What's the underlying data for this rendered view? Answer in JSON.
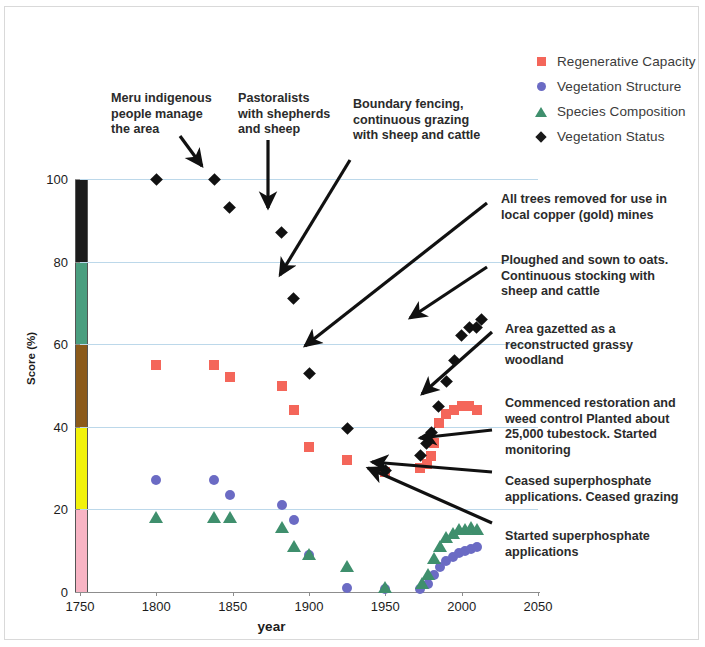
{
  "chart_data": {
    "type": "scatter",
    "title": "",
    "xlabel": "year",
    "ylabel": "Score (%)",
    "xlim": [
      1750,
      2050
    ],
    "ylim": [
      0,
      100
    ],
    "xticks": [
      1750,
      1800,
      1850,
      1900,
      1950,
      2000,
      2050
    ],
    "yticks": [
      0,
      20,
      40,
      60,
      80,
      100
    ],
    "grid": true,
    "legend_position": "top-right",
    "series": [
      {
        "name": "Regenerative Capacity",
        "marker": "square",
        "color": "#f4665a",
        "points": [
          {
            "x": 1800,
            "y": 55
          },
          {
            "x": 1838,
            "y": 55
          },
          {
            "x": 1848,
            "y": 52
          },
          {
            "x": 1882,
            "y": 50
          },
          {
            "x": 1890,
            "y": 44
          },
          {
            "x": 1900,
            "y": 35
          },
          {
            "x": 1925,
            "y": 32
          },
          {
            "x": 1950,
            "y": 29
          },
          {
            "x": 1973,
            "y": 30
          },
          {
            "x": 1977,
            "y": 31
          },
          {
            "x": 1980,
            "y": 33
          },
          {
            "x": 1982,
            "y": 36
          },
          {
            "x": 1985,
            "y": 41
          },
          {
            "x": 1990,
            "y": 43
          },
          {
            "x": 1995,
            "y": 44
          },
          {
            "x": 2000,
            "y": 45
          },
          {
            "x": 2005,
            "y": 45
          },
          {
            "x": 2010,
            "y": 44
          }
        ]
      },
      {
        "name": "Vegetation Structure",
        "marker": "circle",
        "color": "#6b6bc4",
        "points": [
          {
            "x": 1800,
            "y": 27
          },
          {
            "x": 1838,
            "y": 27
          },
          {
            "x": 1848,
            "y": 23.5
          },
          {
            "x": 1882,
            "y": 21
          },
          {
            "x": 1890,
            "y": 17.5
          },
          {
            "x": 1900,
            "y": 9
          },
          {
            "x": 1925,
            "y": 1
          },
          {
            "x": 1950,
            "y": 0.8
          },
          {
            "x": 1973,
            "y": 0.8
          },
          {
            "x": 1978,
            "y": 2
          },
          {
            "x": 1982,
            "y": 4
          },
          {
            "x": 1986,
            "y": 6
          },
          {
            "x": 1990,
            "y": 7.5
          },
          {
            "x": 1994,
            "y": 8.5
          },
          {
            "x": 1998,
            "y": 9.5
          },
          {
            "x": 2002,
            "y": 10
          },
          {
            "x": 2006,
            "y": 10.5
          },
          {
            "x": 2010,
            "y": 11
          }
        ]
      },
      {
        "name": "Species Composition",
        "marker": "triangle",
        "color": "#3f8f6d",
        "points": [
          {
            "x": 1800,
            "y": 18
          },
          {
            "x": 1838,
            "y": 18
          },
          {
            "x": 1848,
            "y": 18
          },
          {
            "x": 1882,
            "y": 15.5
          },
          {
            "x": 1890,
            "y": 11
          },
          {
            "x": 1900,
            "y": 9
          },
          {
            "x": 1925,
            "y": 6
          },
          {
            "x": 1950,
            "y": 1
          },
          {
            "x": 1974,
            "y": 2
          },
          {
            "x": 1978,
            "y": 4
          },
          {
            "x": 1982,
            "y": 8
          },
          {
            "x": 1986,
            "y": 11
          },
          {
            "x": 1990,
            "y": 13
          },
          {
            "x": 1994,
            "y": 14
          },
          {
            "x": 1998,
            "y": 15
          },
          {
            "x": 2002,
            "y": 15
          },
          {
            "x": 2006,
            "y": 15.5
          },
          {
            "x": 2010,
            "y": 15
          }
        ]
      },
      {
        "name": "Vegetation Status",
        "marker": "diamond",
        "color": "#111111",
        "points": [
          {
            "x": 1800,
            "y": 100
          },
          {
            "x": 1838,
            "y": 100
          },
          {
            "x": 1848,
            "y": 93
          },
          {
            "x": 1882,
            "y": 87
          },
          {
            "x": 1890,
            "y": 71
          },
          {
            "x": 1900,
            "y": 53
          },
          {
            "x": 1925,
            "y": 39.5
          },
          {
            "x": 1950,
            "y": 29.5
          },
          {
            "x": 1973,
            "y": 33
          },
          {
            "x": 1977,
            "y": 36
          },
          {
            "x": 1980,
            "y": 38.5
          },
          {
            "x": 1985,
            "y": 45
          },
          {
            "x": 1990,
            "y": 51
          },
          {
            "x": 1995,
            "y": 56
          },
          {
            "x": 2000,
            "y": 62
          },
          {
            "x": 2005,
            "y": 64
          },
          {
            "x": 2010,
            "y": 64
          },
          {
            "x": 2013,
            "y": 66
          }
        ]
      }
    ],
    "colorbar": {
      "label": "",
      "bands": [
        {
          "from": 80,
          "to": 100,
          "color": "#1c1c1c"
        },
        {
          "from": 60,
          "to": 80,
          "color": "#4a9e7f"
        },
        {
          "from": 40,
          "to": 60,
          "color": "#8b5a1a"
        },
        {
          "from": 20,
          "to": 40,
          "color": "#f2f20a"
        },
        {
          "from": 0,
          "to": 20,
          "color": "#f8b4c4"
        }
      ]
    },
    "annotations": [
      "Meru indigenous people manage the area",
      "Pastoralists with shepherds and sheep",
      "Boundary fencing, continuous grazing with sheep and cattle",
      "All trees removed for use in local copper (gold) mines",
      "Ploughed and sown to oats. Continuous stocking with sheep and cattle",
      "Area gazetted as a reconstructed grassy woodland",
      "Commenced restoration and weed control Planted about 25,000 tubestock. Started monitoring",
      "Ceased superphosphate applications. Ceased grazing",
      "Started superphosphate applications"
    ]
  },
  "legend": {
    "items": [
      {
        "label": "Regenerative Capacity",
        "marker": "square"
      },
      {
        "label": "Vegetation Structure",
        "marker": "circle"
      },
      {
        "label": "Species Composition",
        "marker": "triangle"
      },
      {
        "label": "Vegetation Status",
        "marker": "diamond"
      }
    ]
  },
  "axes": {
    "x_title": "year",
    "y_title": "Score (%)",
    "x_ticks": [
      "1750",
      "1800",
      "1850",
      "1900",
      "1950",
      "2000",
      "2050"
    ],
    "y_ticks": [
      "0",
      "20",
      "40",
      "60",
      "80",
      "100"
    ]
  },
  "annotations": {
    "a1": {
      "line1": "Meru indigenous",
      "line2": "people manage",
      "line3": "the area"
    },
    "a2": {
      "line1": "Pastoralists",
      "line2": "with shepherds",
      "line3": "and sheep"
    },
    "a3": {
      "line1": "Boundary fencing,",
      "line2": "continuous grazing",
      "line3": "with sheep and cattle"
    },
    "a4": {
      "line1": "All trees removed for use in",
      "line2": "local copper (gold) mines"
    },
    "a5": {
      "line1": "Ploughed and sown to oats.",
      "line2": "Continuous stocking with",
      "line3": "sheep and cattle"
    },
    "a6": {
      "line1": "Area gazetted as a",
      "line2": "reconstructed grassy",
      "line3": "woodland"
    },
    "a7": {
      "line1": "Commenced restoration and",
      "line2": "weed control Planted about",
      "line3": "25,000 tubestock. Started",
      "line4": "monitoring"
    },
    "a8": {
      "line1": "Ceased superphosphate",
      "line2": "applications. Ceased grazing"
    },
    "a9": {
      "line1": "Started superphosphate",
      "line2": "applications"
    }
  }
}
